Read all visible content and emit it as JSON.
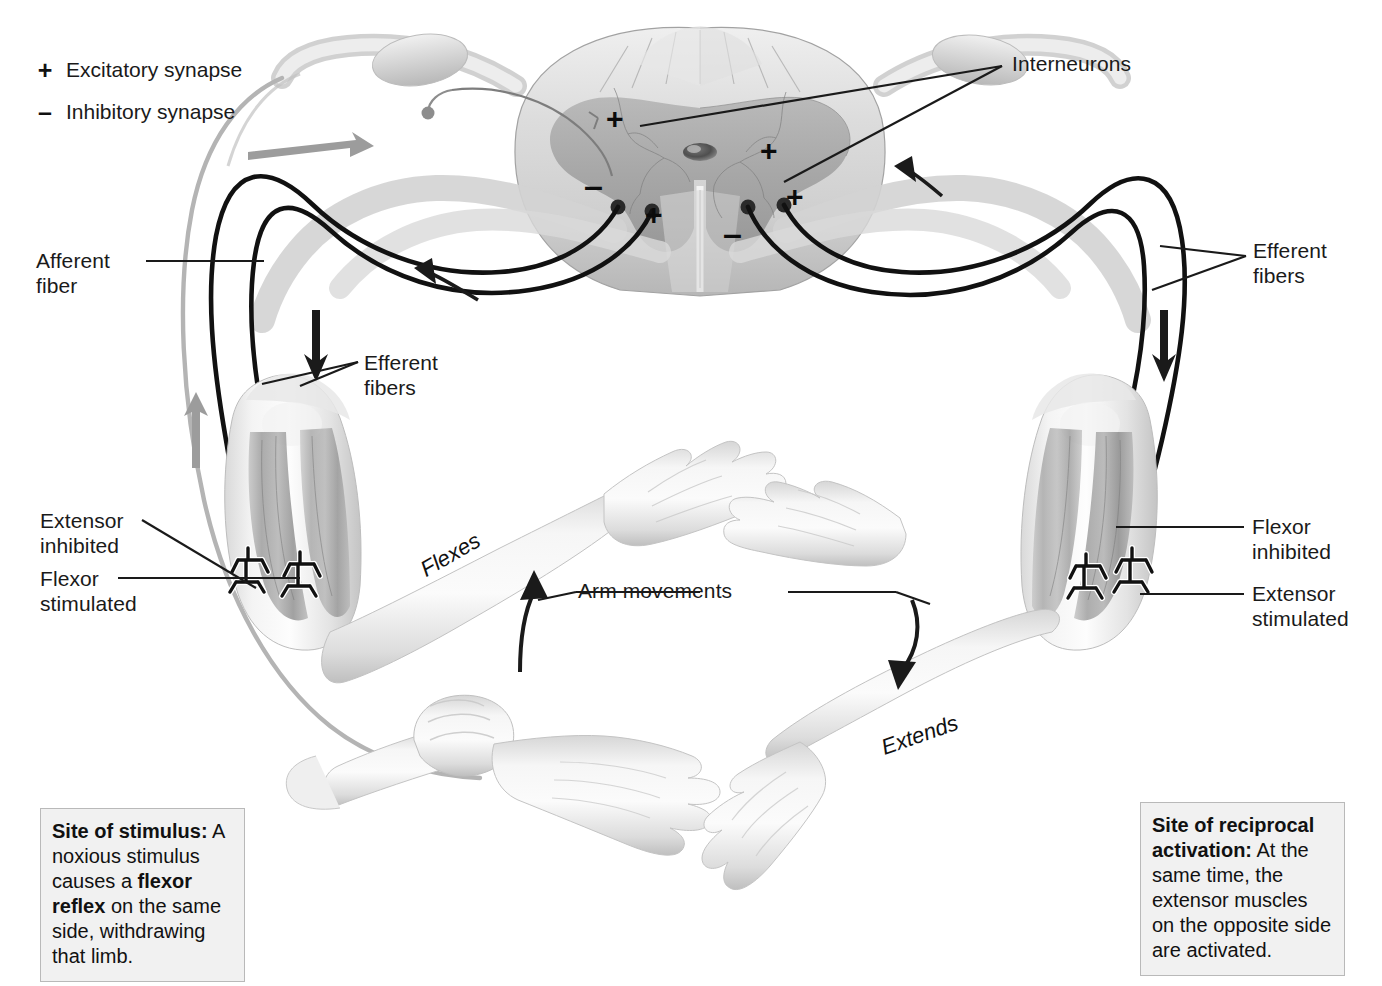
{
  "figure": {
    "title_partial": "",
    "legend": [
      {
        "symbol": "+",
        "label": "Excitatory synapse",
        "name": "excitatory"
      },
      {
        "symbol": "–",
        "label": "Inhibitory synapse",
        "name": "inhibitory"
      }
    ],
    "labels": {
      "interneurons": "Interneurons",
      "afferent_fiber": "Afferent\nfiber",
      "efferent_fibers_left": "Efferent\nfibers",
      "efferent_fibers_right": "Efferent\nfibers",
      "extensor_inhibited": "Extensor\ninhibited",
      "flexor_stimulated": "Flexor\nstimulated",
      "flexor_inhibited": "Flexor\ninhibited",
      "extensor_stimulated": "Extensor\nstimulated",
      "arm_movements": "Arm movements",
      "flexes": "Flexes",
      "extends": "Extends"
    },
    "synapse_marks": [
      {
        "sign": "+",
        "x": 612,
        "y": 110,
        "side": "left-dorsal-horn"
      },
      {
        "sign": "–",
        "x": 590,
        "y": 178,
        "side": "left-ventral-horn"
      },
      {
        "sign": "+",
        "x": 649,
        "y": 208,
        "side": "left-ventral-horn"
      },
      {
        "sign": "+",
        "x": 765,
        "y": 143,
        "side": "right-intermediate"
      },
      {
        "sign": "+",
        "x": 790,
        "y": 190,
        "side": "right-ventral-horn"
      },
      {
        "sign": "–",
        "x": 729,
        "y": 225,
        "side": "right-ventral-horn"
      }
    ],
    "captions": {
      "left": {
        "heading": "Site of stimulus:",
        "body_1": " A noxious stimulus causes a ",
        "bold_1": "flexor reflex",
        "body_2": " on the same side, withdrawing that limb."
      },
      "right": {
        "heading": "Site of reciprocal activation:",
        "body_1": " At the same time, the extensor muscles on the opposite side are activated."
      }
    },
    "colors": {
      "ink": "#1a1a1a",
      "nerve_dark": "#111111",
      "afferent_gray": "#9a9a9a",
      "cord_gray": "#c8c8c8",
      "gray_matter": "#a8a8a8",
      "caption_bg": "#f1f1f1",
      "caption_border": "#b9b9b9",
      "skin_light": "#ececec",
      "muscle_mid": "#8f8f8f"
    }
  }
}
